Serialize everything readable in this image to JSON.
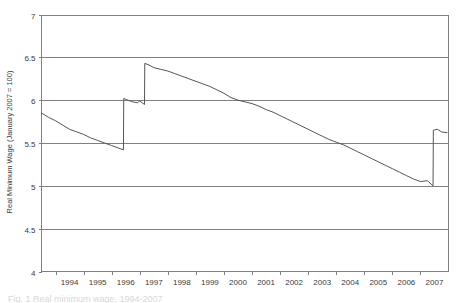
{
  "figure": {
    "caption": "Fig. 1 Real minimum wage, 1994-2007"
  },
  "axis": {
    "y_title": "Real Minimum Wage (January 2007 = 100)",
    "y_ticks": [
      "4",
      "4.5",
      "5",
      "5.5",
      "6",
      "6.5",
      "7"
    ],
    "x_ticks": [
      "1994",
      "1995",
      "1996",
      "1997",
      "1998",
      "1999",
      "2000",
      "2001",
      "2002",
      "2003",
      "2004",
      "2005",
      "2006",
      "2007"
    ]
  },
  "colors": {
    "background": "#ffffff",
    "grid": "#808080",
    "series": "#555555",
    "text": "#3a3a3a"
  },
  "chart_data": {
    "type": "line",
    "title": "",
    "xlabel": "",
    "ylabel": "Real Minimum Wage (January 2007 = 100)",
    "xlim": [
      1993.5,
      2008.0
    ],
    "ylim": [
      4,
      7
    ],
    "ytick_values": [
      4,
      4.5,
      5,
      5.5,
      6,
      6.5,
      7
    ],
    "xtick_values": [
      1994,
      1995,
      1996,
      1997,
      1998,
      1999,
      2000,
      2001,
      2002,
      2003,
      2004,
      2005,
      2006,
      2007
    ],
    "grid": true,
    "legend": "none",
    "series": [
      {
        "name": "Real Minimum Wage",
        "x": [
          1993.5,
          1993.75,
          1994.0,
          1994.25,
          1994.5,
          1994.75,
          1995.0,
          1995.25,
          1995.5,
          1995.75,
          1996.0,
          1996.25,
          1996.42,
          1996.43,
          1996.58,
          1996.75,
          1996.92,
          1997.0,
          1997.17,
          1997.18,
          1997.33,
          1997.5,
          1997.75,
          1998.0,
          1998.25,
          1998.5,
          1998.75,
          1999.0,
          1999.25,
          1999.5,
          1999.75,
          2000.0,
          2000.25,
          2000.5,
          2000.75,
          2001.0,
          2001.25,
          2001.5,
          2001.75,
          2002.0,
          2002.25,
          2002.5,
          2002.75,
          2003.0,
          2003.25,
          2003.5,
          2003.75,
          2004.0,
          2004.25,
          2004.5,
          2004.75,
          2005.0,
          2005.25,
          2005.5,
          2005.75,
          2006.0,
          2006.25,
          2006.5,
          2006.75,
          2007.0,
          2007.25,
          2007.45,
          2007.46,
          2007.6,
          2007.75,
          2007.95
        ],
        "y": [
          5.85,
          5.8,
          5.76,
          5.71,
          5.66,
          5.63,
          5.6,
          5.56,
          5.53,
          5.5,
          5.47,
          5.44,
          5.42,
          6.02,
          6.0,
          5.98,
          5.97,
          5.99,
          5.95,
          6.43,
          6.41,
          6.38,
          6.36,
          6.34,
          6.31,
          6.28,
          6.25,
          6.22,
          6.19,
          6.16,
          6.12,
          6.08,
          6.03,
          6.0,
          5.98,
          5.96,
          5.93,
          5.89,
          5.86,
          5.82,
          5.78,
          5.74,
          5.7,
          5.66,
          5.62,
          5.58,
          5.54,
          5.51,
          5.48,
          5.44,
          5.4,
          5.36,
          5.32,
          5.28,
          5.24,
          5.2,
          5.16,
          5.12,
          5.08,
          5.05,
          5.06,
          5.0,
          5.65,
          5.66,
          5.63,
          5.62
        ]
      }
    ]
  }
}
